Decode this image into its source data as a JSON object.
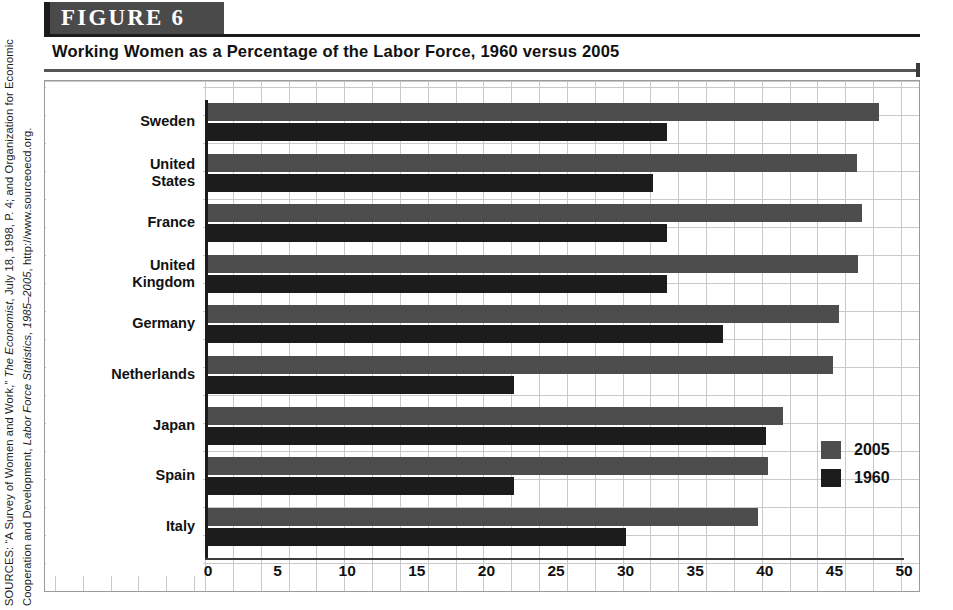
{
  "figure": {
    "banner_label": "FIGURE  6",
    "title": "Working Women as a Percentage of the Labor Force, 1960 versus 2005"
  },
  "source_note": {
    "prefix": "SOURCES: “A Survey of Women and Work,” ",
    "italic_1": "The Economist",
    "middle": ", July 18, 1998, P. 4; and Organization for Economic Cooperation and Development, ",
    "italic_2": "Labor Force Statistics, 1985–2005",
    "suffix": ", http://www.sourceoecd.org."
  },
  "chart_data": {
    "type": "bar",
    "orientation": "horizontal",
    "title": "Working Women as a Percentage of the Labor Force, 1960 versus 2005",
    "xlabel": "",
    "ylabel": "",
    "xlim": [
      0,
      50
    ],
    "xticks": [
      0,
      5,
      10,
      15,
      20,
      25,
      30,
      35,
      40,
      45,
      50
    ],
    "grid": true,
    "legend_position": "bottom-right",
    "categories": [
      "Sweden",
      "United States",
      "France",
      "United Kingdom",
      "Germany",
      "Netherlands",
      "Japan",
      "Spain",
      "Italy"
    ],
    "series": [
      {
        "name": "2005",
        "color": "#4d4d4d",
        "values": [
          48.2,
          46.6,
          47.0,
          46.7,
          45.3,
          44.9,
          41.3,
          40.2,
          39.5
        ]
      },
      {
        "name": "1960",
        "color": "#1c1c1c",
        "values": [
          33.0,
          32.0,
          33.0,
          33.0,
          37.0,
          22.0,
          40.1,
          22.0,
          30.0
        ]
      }
    ]
  },
  "legend": {
    "items": [
      {
        "label": "2005"
      },
      {
        "label": "1960"
      }
    ]
  }
}
